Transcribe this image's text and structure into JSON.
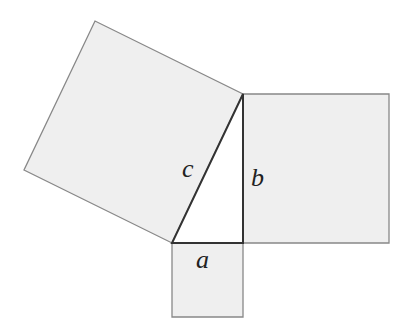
{
  "diagram": {
    "title": "",
    "colors": {
      "square_fill": "#efefef",
      "square_stroke": "#888888",
      "triangle_fill": "#ffffff",
      "triangle_stroke": "#333333",
      "label": "#222222"
    },
    "triangle": {
      "vertices": [
        [
          172,
          243
        ],
        [
          243,
          243
        ],
        [
          243,
          94
        ]
      ],
      "sides": {
        "a": "a",
        "b": "b",
        "c": "c"
      }
    },
    "squares": [
      {
        "name": "square-a",
        "side": "a",
        "points": "172,243 243,243 243,317 172,317"
      },
      {
        "name": "square-b",
        "side": "b",
        "points": "243,94 389,94 389,243 243,243"
      },
      {
        "name": "square-c",
        "side": "c",
        "points": "172,243 243,94 95,21 24,170"
      }
    ],
    "labels": {
      "a": {
        "text": "a",
        "x": 196,
        "y": 268
      },
      "b": {
        "text": "b",
        "x": 251,
        "y": 186
      },
      "c": {
        "text": "c",
        "x": 182,
        "y": 177
      }
    }
  }
}
